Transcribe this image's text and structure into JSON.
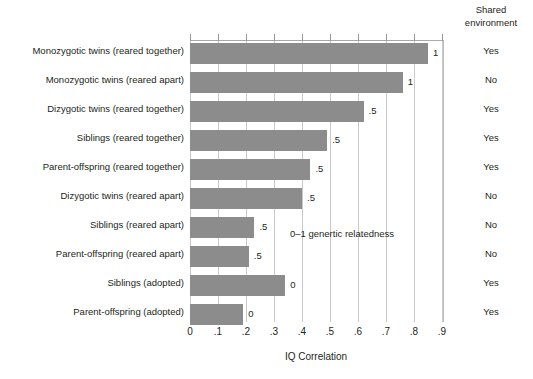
{
  "chart_data": {
    "type": "bar",
    "orientation": "horizontal",
    "title": "",
    "xlabel": "IQ Correlation",
    "ylabel": "",
    "xlim": [
      0,
      0.9
    ],
    "xticks": [
      "0",
      ".1",
      ".2",
      ".3",
      ".4",
      ".5",
      ".6",
      ".7",
      ".8",
      ".9"
    ],
    "xtick_values": [
      0,
      0.1,
      0.2,
      0.3,
      0.4,
      0.5,
      0.6,
      0.7,
      0.8,
      0.9
    ],
    "grid": "vertical",
    "legend": "none",
    "bar_color": "#8c8c8c",
    "annotation": "0–1 genertic relatedness",
    "categories": [
      "Monozygotic twins (reared together)",
      "Monozygotic twins (reared apart)",
      "Dizygotic twins (reared together)",
      "Siblings (reared together)",
      "Parent-offspring (reared together)",
      "Dizygotic twins (reared apart)",
      "Siblings (reared apart)",
      "Parent-offspring (reared apart)",
      "Siblings (adopted)",
      "Parent-offspring (adopted)"
    ],
    "values": [
      0.85,
      0.76,
      0.62,
      0.49,
      0.43,
      0.4,
      0.23,
      0.21,
      0.34,
      0.19
    ],
    "data_labels": [
      "1",
      "1",
      ".5",
      ".5",
      ".5",
      ".5",
      ".5",
      ".5",
      "0",
      "0"
    ],
    "extra_column": {
      "header_line1": "Shared",
      "header_line2": "environment",
      "values": [
        "Yes",
        "No",
        "Yes",
        "Yes",
        "Yes",
        "No",
        "No",
        "No",
        "Yes",
        "Yes"
      ]
    }
  }
}
